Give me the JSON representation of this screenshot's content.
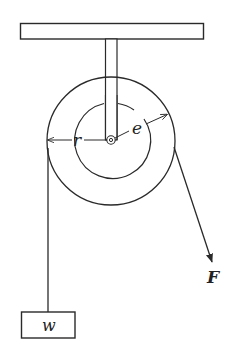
{
  "diagram": {
    "type": "pulley-system",
    "labels": {
      "radius": "r",
      "effective_radius": "e",
      "force": "F",
      "weight": "w"
    },
    "colors": {
      "stroke": "#2a2a2a",
      "background": "#ffffff"
    }
  }
}
